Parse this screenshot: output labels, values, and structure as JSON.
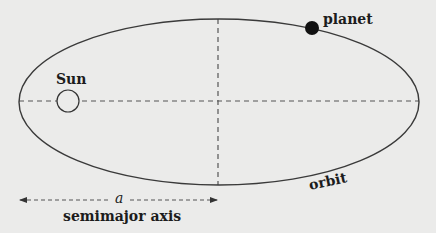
{
  "diagram": {
    "type": "orbital-ellipse",
    "labels": {
      "sun": "Sun",
      "planet": "planet",
      "orbit": "orbit",
      "semimajor_symbol": "a",
      "semimajor_caption": "semimajor axis"
    },
    "colors": {
      "background": "#ebebea",
      "stroke": "#3a3a3a",
      "dashed": "#555555",
      "planet_fill": "#111111",
      "text": "#1c1c1c"
    },
    "geometry": {
      "ellipse": {
        "cx": 219,
        "cy": 102,
        "rx": 200,
        "ry": 83
      },
      "sun": {
        "cx": 68,
        "cy": 101,
        "r": 11
      },
      "planet": {
        "cx": 312,
        "cy": 28,
        "r": 7
      },
      "major_axis_y": 101,
      "minor_axis_x": 218,
      "arrow": {
        "x1": 20,
        "x2": 217,
        "y": 200
      }
    }
  }
}
